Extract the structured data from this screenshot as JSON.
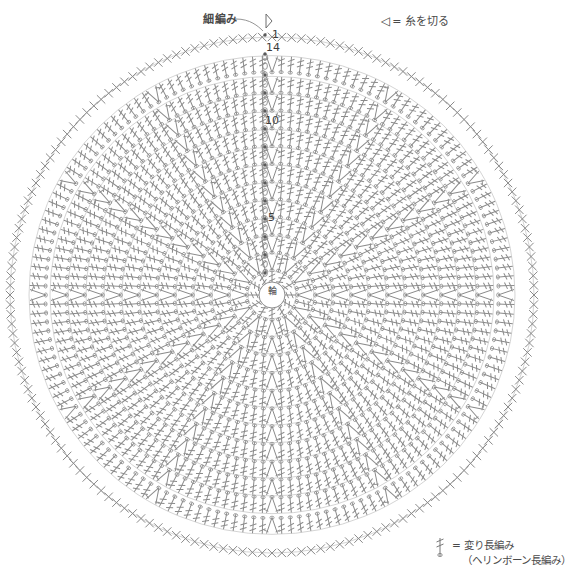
{
  "page": {
    "width": 549,
    "height": 583,
    "background": "#ffffff",
    "ink": "#707070"
  },
  "annotations": {
    "single_crochet_label": "細編み",
    "center_ring_label": "輪",
    "legend_cut_symbol": "◁",
    "legend_cut_text": "= 糸を切る",
    "legend_hdc_line1": "= 変り長編み",
    "legend_hdc_line2": "（ヘリンボーン長編み）"
  },
  "round_numbers": {
    "start": "1",
    "r14": "14",
    "r10": "10",
    "r5": "5"
  },
  "chart_data": {
    "type": "diagram",
    "geometry": {
      "center_x": 272,
      "center_y": 295,
      "inner_ring_radius": 13,
      "outer_radius": 272,
      "rounds": 14,
      "spokes": 12
    },
    "round_radii": [
      24,
      42,
      60,
      78,
      96,
      114,
      132,
      150,
      168,
      186,
      204,
      222,
      243,
      262
    ],
    "round_stitch_counts": [
      12,
      24,
      36,
      48,
      60,
      72,
      84,
      96,
      108,
      120,
      132,
      144,
      156,
      168
    ],
    "rounds": [
      {
        "n": 1,
        "stitch": "herringbone-dc",
        "increase": "every stitch"
      },
      {
        "n": 2,
        "stitch": "herringbone-dc",
        "increase": "every spoke"
      },
      {
        "n": 3,
        "stitch": "herringbone-dc",
        "increase": "every spoke"
      },
      {
        "n": 4,
        "stitch": "herringbone-dc",
        "increase": "every spoke"
      },
      {
        "n": 5,
        "stitch": "herringbone-dc",
        "increase": "every spoke"
      },
      {
        "n": 6,
        "stitch": "herringbone-dc",
        "increase": "every spoke"
      },
      {
        "n": 7,
        "stitch": "herringbone-dc",
        "increase": "every spoke"
      },
      {
        "n": 8,
        "stitch": "herringbone-dc",
        "increase": "every spoke"
      },
      {
        "n": 9,
        "stitch": "herringbone-dc",
        "increase": "every spoke"
      },
      {
        "n": 10,
        "stitch": "herringbone-dc",
        "increase": "every spoke"
      },
      {
        "n": 11,
        "stitch": "herringbone-dc",
        "increase": "every spoke"
      },
      {
        "n": 12,
        "stitch": "herringbone-dc",
        "increase": "every spoke"
      },
      {
        "n": 13,
        "stitch": "herringbone-dc",
        "increase": "every spoke"
      },
      {
        "n": 14,
        "stitch": "single-crochet",
        "increase": "none",
        "note": "finish, cut yarn"
      }
    ],
    "symbols": [
      {
        "name": "herringbone-dc",
        "glyph": "slanted bar with two cross ticks",
        "label": "変り長編み（ヘリンボーン長編み）"
      },
      {
        "name": "single-crochet",
        "glyph": "X",
        "label": "細編み"
      },
      {
        "name": "cut-yarn",
        "glyph": "◁",
        "label": "糸を切る"
      },
      {
        "name": "chain",
        "glyph": "oval",
        "label": "くさり編み"
      },
      {
        "name": "increase-V",
        "glyph": "V",
        "label": "increase: 2 stitches in one"
      }
    ]
  }
}
